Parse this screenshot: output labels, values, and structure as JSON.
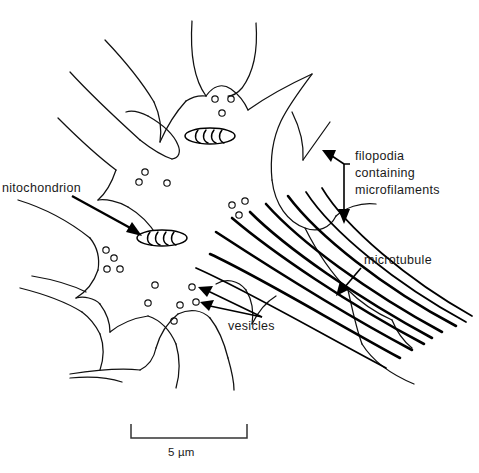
{
  "figure": {
    "background_color": "#ffffff",
    "ink_color": "#111111",
    "width_px": 479,
    "height_px": 473
  },
  "labels": {
    "mitochondrion": "nitochondrion",
    "mitochondrion_full": "mitochondrion",
    "filopodia_line1": "filopodia",
    "filopodia_line2": "containing",
    "filopodia_line3": "microfilaments",
    "microtubule": "microtubule",
    "vesicles": "vesicles"
  },
  "scale_bar": {
    "label": "5 µm",
    "length_px": 116,
    "x_start": 131,
    "x_end": 247,
    "y": 438
  },
  "structures": {
    "mitochondria": [
      {
        "name": "mitochondrion-upper",
        "cx": 210,
        "cy": 136,
        "rx": 25,
        "ry": 8,
        "cristae": 5
      },
      {
        "name": "mitochondrion-lower",
        "cx": 162,
        "cy": 238,
        "rx": 25,
        "ry": 8,
        "cristae": 5
      }
    ],
    "vesicles": [
      {
        "cx": 215,
        "cy": 99,
        "r": 3.2
      },
      {
        "cx": 231,
        "cy": 99,
        "r": 3.2
      },
      {
        "cx": 222,
        "cy": 113,
        "r": 3.2
      },
      {
        "cx": 145,
        "cy": 172,
        "r": 3.2
      },
      {
        "cx": 139,
        "cy": 182,
        "r": 3.2
      },
      {
        "cx": 167,
        "cy": 183,
        "r": 3.2
      },
      {
        "cx": 106,
        "cy": 250,
        "r": 3.2
      },
      {
        "cx": 114,
        "cy": 258,
        "r": 3.2
      },
      {
        "cx": 107,
        "cy": 269,
        "r": 3.2
      },
      {
        "cx": 120,
        "cy": 269,
        "r": 3.2
      },
      {
        "cx": 155,
        "cy": 285,
        "r": 3.2
      },
      {
        "cx": 148,
        "cy": 303,
        "r": 3.2
      },
      {
        "cx": 192,
        "cy": 287,
        "r": 3.2
      },
      {
        "cx": 180,
        "cy": 305,
        "r": 3.2
      },
      {
        "cx": 196,
        "cy": 302,
        "r": 3.2
      },
      {
        "cx": 232,
        "cy": 205,
        "r": 3.2
      },
      {
        "cx": 245,
        "cy": 201,
        "r": 3.2
      },
      {
        "cx": 239,
        "cy": 215,
        "r": 3.2
      },
      {
        "cx": 174,
        "cy": 321,
        "r": 3.2
      }
    ],
    "microtubule_count": 8
  },
  "annotations": [
    {
      "name": "mitochondrion",
      "arrow_from": [
        72,
        196
      ],
      "arrow_to": [
        140,
        234
      ]
    },
    {
      "name": "filopodia",
      "arrow_up_to": [
        325,
        158
      ],
      "arrow_down_to": [
        344,
        221
      ]
    },
    {
      "name": "microtubule",
      "arrow_from": [
        360,
        262
      ],
      "arrow_to": [
        338,
        285
      ]
    },
    {
      "name": "vesicles",
      "arrow_from": [
        262,
        317
      ],
      "arrow_to_1": [
        198,
        289
      ],
      "arrow_to_2": [
        200,
        304
      ]
    }
  ]
}
